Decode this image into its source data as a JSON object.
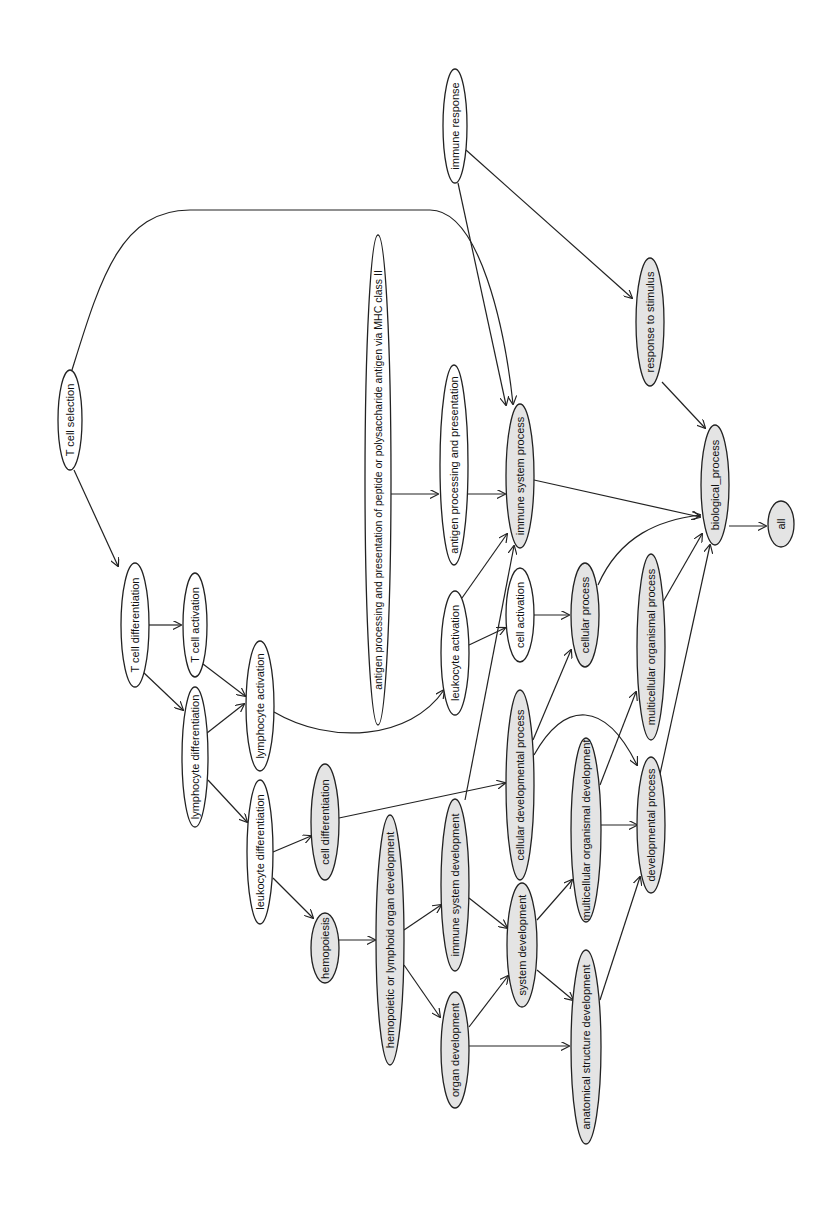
{
  "diagram": {
    "title": "",
    "type": "directed-acyclic-graph",
    "orientation": "rotated-90-ccw",
    "colors": {
      "highlighted_fill": "#e4e4e4",
      "plain_fill": "#ffffff",
      "stroke": "#222222"
    },
    "nodes": [
      {
        "id": "tcs",
        "label": "T cell selection",
        "cx": 70,
        "cy": 420,
        "rx": 12,
        "ry": 50,
        "highlighted": false
      },
      {
        "id": "tcd",
        "label": "T cell differentiation",
        "cx": 135,
        "cy": 625,
        "rx": 14,
        "ry": 62,
        "highlighted": false
      },
      {
        "id": "tca",
        "label": "T cell activation",
        "cx": 195,
        "cy": 625,
        "rx": 12,
        "ry": 52,
        "highlighted": false
      },
      {
        "id": "lyd",
        "label": "lymphocyte differentiation",
        "cx": 195,
        "cy": 757,
        "rx": 13,
        "ry": 70,
        "highlighted": false
      },
      {
        "id": "lya",
        "label": "lymphocyte activation",
        "cx": 260,
        "cy": 706,
        "rx": 14,
        "ry": 65,
        "highlighted": false
      },
      {
        "id": "led",
        "label": "leukocyte differentiation",
        "cx": 260,
        "cy": 852,
        "rx": 13,
        "ry": 72,
        "highlighted": false
      },
      {
        "id": "ced",
        "label": "cell differentiation",
        "cx": 325,
        "cy": 822,
        "rx": 14,
        "ry": 58,
        "highlighted": true
      },
      {
        "id": "hem",
        "label": "hemopoiesis",
        "cx": 325,
        "cy": 948,
        "rx": 14,
        "ry": 35,
        "highlighted": true
      },
      {
        "id": "mhc",
        "label": "antigen processing and presentation of peptide or polysaccharide antigen via MHC class II",
        "cx": 378,
        "cy": 480,
        "rx": 13,
        "ry": 245,
        "highlighted": false
      },
      {
        "id": "app",
        "label": "antigen processing and presentation",
        "cx": 454,
        "cy": 465,
        "rx": 14,
        "ry": 100,
        "highlighted": false
      },
      {
        "id": "lea",
        "label": "leukocyte activation",
        "cx": 455,
        "cy": 653,
        "rx": 14,
        "ry": 62,
        "highlighted": false
      },
      {
        "id": "hlo",
        "label": "hemopoietic or lymphoid organ development",
        "cx": 390,
        "cy": 940,
        "rx": 14,
        "ry": 125,
        "highlighted": true
      },
      {
        "id": "isp",
        "label": "immune system process",
        "cx": 520,
        "cy": 476,
        "rx": 14,
        "ry": 72,
        "highlighted": true
      },
      {
        "id": "cea",
        "label": "cell activation",
        "cx": 520,
        "cy": 615,
        "rx": 14,
        "ry": 47,
        "highlighted": false
      },
      {
        "id": "isd",
        "label": "immune system development",
        "cx": 455,
        "cy": 885,
        "rx": 14,
        "ry": 86,
        "highlighted": true
      },
      {
        "id": "ord",
        "label": "organ development",
        "cx": 455,
        "cy": 1050,
        "rx": 14,
        "ry": 58,
        "highlighted": true
      },
      {
        "id": "cdp",
        "label": "cellular developmental process",
        "cx": 520,
        "cy": 785,
        "rx": 14,
        "ry": 95,
        "highlighted": true
      },
      {
        "id": "cep",
        "label": "cellular process",
        "cx": 585,
        "cy": 615,
        "rx": 14,
        "ry": 52,
        "highlighted": true
      },
      {
        "id": "syd",
        "label": "system development",
        "cx": 522,
        "cy": 945,
        "rx": 15,
        "ry": 62,
        "highlighted": true
      },
      {
        "id": "mod",
        "label": "multicellular organismal development",
        "cx": 586,
        "cy": 830,
        "rx": 15,
        "ry": 92,
        "highlighted": true
      },
      {
        "id": "asd",
        "label": "anatomical structure development",
        "cx": 586,
        "cy": 1047,
        "rx": 15,
        "ry": 97,
        "highlighted": true
      },
      {
        "id": "mop",
        "label": "multicellular organismal process",
        "cx": 651,
        "cy": 647,
        "rx": 14,
        "ry": 93,
        "highlighted": true
      },
      {
        "id": "dep",
        "label": "developmental process",
        "cx": 651,
        "cy": 825,
        "rx": 14,
        "ry": 68,
        "highlighted": true
      },
      {
        "id": "imr",
        "label": "immune response",
        "cx": 455,
        "cy": 126,
        "rx": 12,
        "ry": 57,
        "highlighted": false
      },
      {
        "id": "rts",
        "label": "response to stimulus",
        "cx": 650,
        "cy": 322,
        "rx": 14,
        "ry": 64,
        "highlighted": true
      },
      {
        "id": "bio",
        "label": "biological_process",
        "cx": 715,
        "cy": 485,
        "rx": 14,
        "ry": 60,
        "highlighted": true
      },
      {
        "id": "all",
        "label": "all",
        "cx": 781,
        "cy": 524,
        "rx": 13,
        "ry": 23,
        "highlighted": true
      }
    ],
    "edges": [
      {
        "from": "tcs",
        "to": "tcd",
        "d": "M74,470 L118,566"
      },
      {
        "from": "tcs",
        "to": "isp",
        "d": "M72,370 C100,280 120,210 190,210 L430,210 C480,210 505,330 513,404"
      },
      {
        "from": "tcd",
        "to": "tca",
        "d": "M149,625 L181,625"
      },
      {
        "from": "tcd",
        "to": "lyd",
        "d": "M143,672 L183,710"
      },
      {
        "from": "tca",
        "to": "lya",
        "d": "M203,664 L245,696"
      },
      {
        "from": "lyd",
        "to": "lya",
        "d": "M207,733 L244,704"
      },
      {
        "from": "lyd",
        "to": "led",
        "d": "M208,780 L247,822"
      },
      {
        "from": "lya",
        "to": "lea",
        "d": "M274,712 C330,745 410,740 444,690"
      },
      {
        "from": "led",
        "to": "ced",
        "d": "M273,852 L311,836"
      },
      {
        "from": "led",
        "to": "hem",
        "d": "M273,878 L313,918"
      },
      {
        "from": "hem",
        "to": "hlo",
        "d": "M339,940 L375,940"
      },
      {
        "from": "ced",
        "to": "cdp",
        "d": "M339,818 L505,783"
      },
      {
        "from": "mhc",
        "to": "app",
        "d": "M391,494 L438,494"
      },
      {
        "from": "app",
        "to": "isp",
        "d": "M468,494 L505,494"
      },
      {
        "from": "lea",
        "to": "isp",
        "d": "M462,598 L507,534"
      },
      {
        "from": "lea",
        "to": "cea",
        "d": "M469,645 L505,628"
      },
      {
        "from": "isd",
        "to": "isp",
        "d": "M465,800 L514,546"
      },
      {
        "from": "hlo",
        "to": "isd",
        "d": "M404,930 L441,905"
      },
      {
        "from": "hlo",
        "to": "ord",
        "d": "M404,965 L440,1017"
      },
      {
        "from": "isd",
        "to": "syd",
        "d": "M469,898 L507,928"
      },
      {
        "from": "ord",
        "to": "syd",
        "d": "M469,1027 L508,976"
      },
      {
        "from": "ord",
        "to": "asd",
        "d": "M469,1046 L569,1046"
      },
      {
        "from": "cea",
        "to": "cep",
        "d": "M534,615 L569,615"
      },
      {
        "from": "cdp",
        "to": "cep",
        "d": "M533,740 L571,650"
      },
      {
        "from": "cdp",
        "to": "dep",
        "d": "M534,755 C565,700 605,700 637,765"
      },
      {
        "from": "syd",
        "to": "mod",
        "d": "M537,920 L572,880"
      },
      {
        "from": "syd",
        "to": "asd",
        "d": "M537,970 L573,1000"
      },
      {
        "from": "mod",
        "to": "mop",
        "d": "M600,785 L636,692"
      },
      {
        "from": "mod",
        "to": "dep",
        "d": "M601,825 L637,825"
      },
      {
        "from": "asd",
        "to": "dep",
        "d": "M600,1000 L640,877"
      },
      {
        "from": "isp",
        "to": "bio",
        "d": "M534,480 L700,517"
      },
      {
        "from": "cep",
        "to": "bio",
        "d": "M598,585 C620,535 660,520 700,515"
      },
      {
        "from": "mop",
        "to": "bio",
        "d": "M663,602 L702,534"
      },
      {
        "from": "dep",
        "to": "bio",
        "d": "M660,774 L710,545"
      },
      {
        "from": "rts",
        "to": "bio",
        "d": "M662,382 L705,428"
      },
      {
        "from": "imr",
        "to": "rts",
        "d": "M466,150 L632,298"
      },
      {
        "from": "imr",
        "to": "isp",
        "d": "M458,183 L506,405"
      },
      {
        "from": "bio",
        "to": "all",
        "d": "M729,526 L766,526"
      }
    ]
  }
}
